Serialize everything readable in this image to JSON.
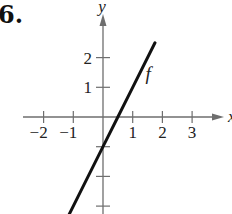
{
  "problem": {
    "number": "6."
  },
  "chart_data": {
    "type": "line",
    "title": "",
    "xlabel": "x",
    "ylabel": "y",
    "xlim": [
      -2.7,
      3.9
    ],
    "ylim": [
      -3.2,
      2.8
    ],
    "x_ticks": [
      -2,
      -1,
      1,
      2,
      3
    ],
    "x_tick_labels": [
      "−2",
      "−1",
      "1",
      "2",
      "3"
    ],
    "y_ticks": [
      2,
      1,
      -1,
      -2,
      -3
    ],
    "y_tick_labels": [
      "2",
      "1",
      "",
      "",
      ""
    ],
    "grid": false,
    "legend": null,
    "series": [
      {
        "name": "f",
        "equation": "f(x) = 2x - 1",
        "x": [
          -1.2,
          0,
          0.5,
          1,
          1.75
        ],
        "values": [
          -3.4,
          -1,
          0,
          1,
          2.5
        ]
      }
    ],
    "annotations": [
      {
        "text": "f",
        "x": 1.3,
        "y": 1.3
      }
    ]
  },
  "colors": {
    "axis": "#6e6e6e",
    "curve": "#111111",
    "text": "#222222"
  }
}
